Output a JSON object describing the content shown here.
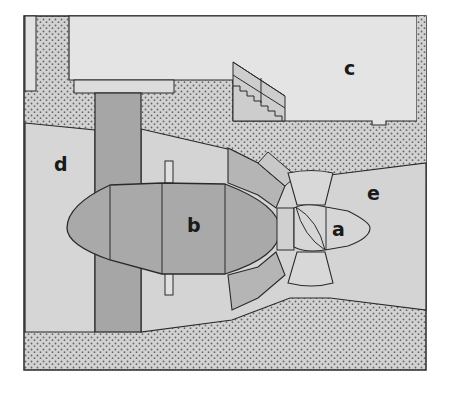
{
  "diagram": {
    "type": "cross-section schematic (bulb turbine installation)",
    "labels": {
      "a": "a",
      "b": "b",
      "c": "c",
      "d": "d",
      "e": "e"
    },
    "colors": {
      "background": "#ffffff",
      "concrete_stipple": "#cfcfcf",
      "stipple_dot": "#6e6e6e",
      "water_light": "#d6d6d6",
      "building_light": "#e4e4e4",
      "bulb_dark": "#a9a9a9",
      "pillar_dark": "#a3a3a3",
      "segment_mid": "#b8b8b8",
      "outline": "#2a2a2a"
    }
  }
}
